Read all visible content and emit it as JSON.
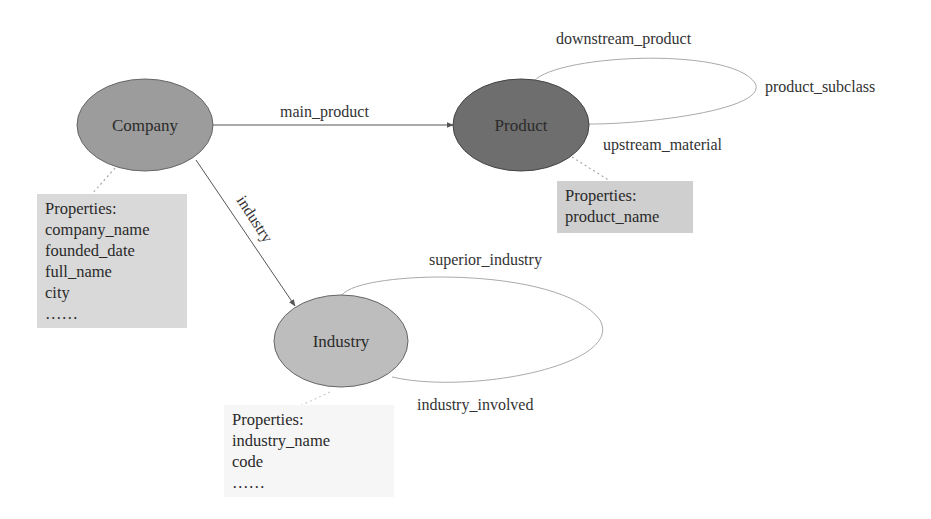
{
  "nodes": {
    "company": {
      "label": "Company",
      "fill": "#9c9c9c"
    },
    "product": {
      "label": "Product",
      "fill": "#6e6e6e"
    },
    "industry": {
      "label": "Industry",
      "fill": "#bdbdbd"
    }
  },
  "edges": {
    "main_product": "main_product",
    "industry": "industry",
    "downstream_product": "downstream_product",
    "product_subclass": "product_subclass",
    "upstream_material": "upstream_material",
    "superior_industry": "superior_industry",
    "industry_involved": "industry_involved"
  },
  "properties": {
    "company": {
      "title": "Properties:",
      "items": [
        "company_name",
        "founded_date",
        "full_name",
        "city",
        "……"
      ]
    },
    "product": {
      "title": "Properties:",
      "items": [
        "product_name"
      ]
    },
    "industry": {
      "title": "Properties:",
      "items": [
        "industry_name",
        "code",
        "……"
      ]
    }
  }
}
